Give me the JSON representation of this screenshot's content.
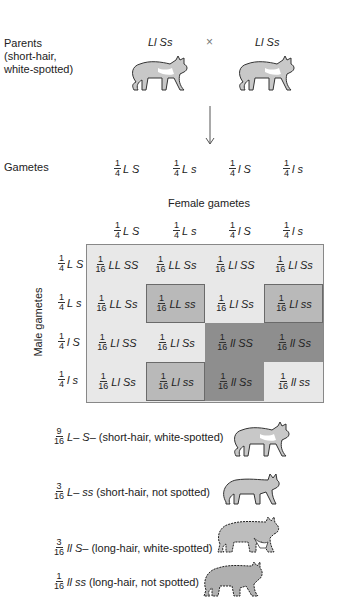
{
  "parents": {
    "label_lines": [
      "Parents",
      "(short-hair,",
      "white-spotted)"
    ],
    "genotype_left": "Ll Ss",
    "genotype_right": "Ll Ss",
    "cross_symbol": "×",
    "cat_icon": "short-hair-white-spotted-cat"
  },
  "gametes": {
    "label": "Gametes",
    "items": [
      {
        "num": "1",
        "den": "4",
        "g": "L S"
      },
      {
        "num": "1",
        "den": "4",
        "g": "L s"
      },
      {
        "num": "1",
        "den": "4",
        "g": "l S"
      },
      {
        "num": "1",
        "den": "4",
        "g": "l s"
      }
    ]
  },
  "punnett": {
    "female_label": "Female gametes",
    "male_label": "Male gametes",
    "female_headers": [
      {
        "num": "1",
        "den": "4",
        "g": "L S"
      },
      {
        "num": "1",
        "den": "4",
        "g": "L s"
      },
      {
        "num": "1",
        "den": "4",
        "g": "l S"
      },
      {
        "num": "1",
        "den": "4",
        "g": "l s"
      }
    ],
    "male_headers": [
      {
        "num": "1",
        "den": "4",
        "g": "L S"
      },
      {
        "num": "1",
        "den": "4",
        "g": "L s"
      },
      {
        "num": "1",
        "den": "4",
        "g": "l S"
      },
      {
        "num": "1",
        "den": "4",
        "g": "l s"
      }
    ],
    "rows": [
      [
        {
          "num": "1",
          "den": "16",
          "g": "LL SS",
          "shade": "light"
        },
        {
          "num": "1",
          "den": "16",
          "g": "LL Ss",
          "shade": "light"
        },
        {
          "num": "1",
          "den": "16",
          "g": "Ll SS",
          "shade": "light"
        },
        {
          "num": "1",
          "den": "16",
          "g": "Ll Ss",
          "shade": "light"
        }
      ],
      [
        {
          "num": "1",
          "den": "16",
          "g": "LL Ss",
          "shade": "light"
        },
        {
          "num": "1",
          "den": "16",
          "g": "LL ss",
          "shade": "medium"
        },
        {
          "num": "1",
          "den": "16",
          "g": "Ll Ss",
          "shade": "light"
        },
        {
          "num": "1",
          "den": "16",
          "g": "Ll ss",
          "shade": "medium"
        }
      ],
      [
        {
          "num": "1",
          "den": "16",
          "g": "Ll SS",
          "shade": "light"
        },
        {
          "num": "1",
          "den": "16",
          "g": "Ll Ss",
          "shade": "light"
        },
        {
          "num": "1",
          "den": "16",
          "g": "ll SS",
          "shade": "dark"
        },
        {
          "num": "1",
          "den": "16",
          "g": "ll Ss",
          "shade": "dark"
        }
      ],
      [
        {
          "num": "1",
          "den": "16",
          "g": "Ll Ss",
          "shade": "light"
        },
        {
          "num": "1",
          "den": "16",
          "g": "Ll ss",
          "shade": "medium"
        },
        {
          "num": "1",
          "den": "16",
          "g": "ll Ss",
          "shade": "dark"
        },
        {
          "num": "1",
          "den": "16",
          "g": "ll ss",
          "shade": "light"
        }
      ]
    ],
    "colors": {
      "light": "#e8e8e8",
      "medium": "#b9b9b9",
      "dark": "#8e8e8e"
    }
  },
  "phenotypes": [
    {
      "num": "9",
      "den": "16",
      "geno": "L– S–",
      "desc": "(short-hair, white-spotted)",
      "cat_icon": "short-hair-white-spotted-cat"
    },
    {
      "num": "3",
      "den": "16",
      "geno": "L– ss",
      "desc": "(short-hair, not spotted)",
      "cat_icon": "short-hair-solid-cat"
    },
    {
      "num": "3",
      "den": "16",
      "geno": "ll S–",
      "desc": "(long-hair, white-spotted)",
      "cat_icon": "long-hair-white-spotted-cat"
    },
    {
      "num": "1",
      "den": "16",
      "geno": "ll ss",
      "desc": "(long-hair, not spotted)",
      "cat_icon": "long-hair-solid-cat"
    }
  ]
}
